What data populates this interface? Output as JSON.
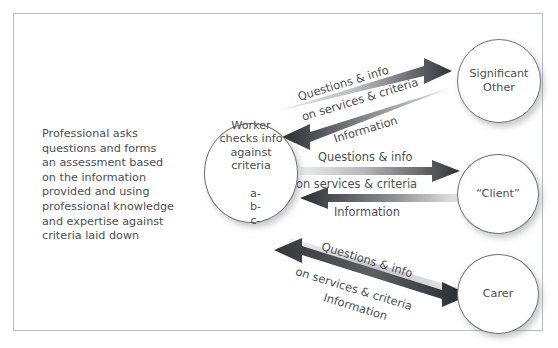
{
  "diagram": {
    "frame": {
      "border_color": "#b9bcc0",
      "background": "#ffffff"
    },
    "left_text": "Professional asks\nquestions and forms\nan assessment based\non the information\nprovided and using\nprofessional knowledge\nand expertise against\ncriteria laid down",
    "nodes": {
      "worker": {
        "label": "Worker\nchecks info\nagainst\ncriteria",
        "sub_items": "a-\nb-\nc-"
      },
      "significant_other": {
        "label": "Significant\nOther"
      },
      "client": {
        "label": "“Client”"
      },
      "carer": {
        "label": "Carer"
      }
    },
    "flows": [
      {
        "id": "top",
        "from": "worker",
        "to": "significant_other",
        "labels": {
          "outbound": "Questions & info",
          "middle": "on services & criteria",
          "inbound": "Information"
        }
      },
      {
        "id": "middle",
        "from": "worker",
        "to": "client",
        "labels": {
          "outbound": "Questions & info",
          "middle": "on services & criteria",
          "inbound": "Information"
        }
      },
      {
        "id": "bottom",
        "from": "worker",
        "to": "carer",
        "labels": {
          "outbound": "Questions & info",
          "middle": "on services & criteria",
          "inbound": "Information"
        }
      }
    ],
    "colors": {
      "text": "#4b4f54",
      "circle_stroke": "#6f7479",
      "arrow_dark": "#333333",
      "arrow_light": "#d8dadc"
    }
  }
}
